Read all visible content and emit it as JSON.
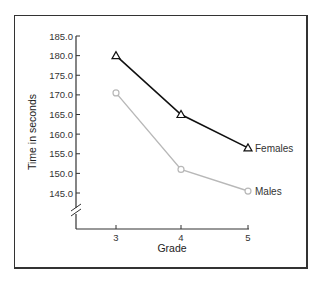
{
  "chart_data": {
    "type": "line",
    "title": "",
    "xlabel": "Grade",
    "ylabel": "Time in seconds",
    "categories": [
      "3",
      "4",
      "5"
    ],
    "x": [
      3,
      4,
      5
    ],
    "series": [
      {
        "name": "Females",
        "values": [
          180.0,
          165.0,
          156.5
        ],
        "color": "#111111",
        "marker": "triangle"
      },
      {
        "name": "Males",
        "values": [
          170.5,
          151.0,
          145.5
        ],
        "color": "#b8b8b8",
        "marker": "circle"
      }
    ],
    "yticks": [
      "185.0",
      "180.0",
      "175.0",
      "170.0",
      "165.0",
      "160.0",
      "155.0",
      "150.0",
      "145.0"
    ],
    "ylim": [
      145.0,
      185.0
    ],
    "y_axis_break": true,
    "grid": false,
    "legend": "inline labels at line ends"
  }
}
